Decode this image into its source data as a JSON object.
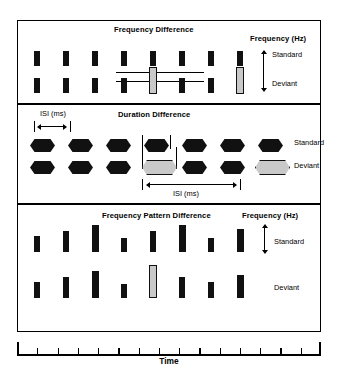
{
  "figure": {
    "axis_label": "Time",
    "axis_ticks": 14
  },
  "panels": [
    {
      "id": "frequency-difference",
      "title": "Frequency Difference",
      "legend_title": "Frequency (Hz)",
      "row_labels": [
        "Standard",
        "Deviant"
      ],
      "tone_shape": "rectangle",
      "tone_count": 8,
      "deviant_index": 4
    },
    {
      "id": "duration-difference",
      "title": "Duration Difference",
      "isi_label_top": "ISI (ms)",
      "isi_label_bottom": "ISI (ms)",
      "row_labels": [
        "Standard",
        "Deviant"
      ],
      "tone_shape": "hexagon",
      "tone_count": 7,
      "deviant_indices": [
        3,
        6
      ]
    },
    {
      "id": "frequency-pattern-difference",
      "title": "Frequency Pattern Difference",
      "legend_title": "Frequency (Hz)",
      "row_labels": [
        "Standard",
        "Deviant"
      ],
      "tone_shape": "rectangle",
      "tone_count": 8,
      "deviant_index": 4
    }
  ],
  "chart_data": {
    "type": "diagram",
    "xlabel": "Time",
    "ylabel": "Frequency (Hz)",
    "grid": false,
    "legend_position": "right",
    "panel_frequency_difference": {
      "title": "Frequency Difference",
      "series": [
        {
          "name": "Standard",
          "tone_x": [
            8,
            20,
            32,
            44,
            56,
            68,
            80,
            92
          ],
          "tone_frequency_level": [
            1,
            1,
            1,
            1,
            1,
            1,
            1,
            1
          ],
          "deviant_flags": [
            false,
            false,
            false,
            false,
            false,
            false,
            false,
            false
          ]
        },
        {
          "name": "Deviant",
          "tone_x": [
            8,
            20,
            32,
            44,
            56,
            68,
            80,
            92
          ],
          "tone_frequency_level": [
            1,
            1,
            1,
            1,
            2,
            1,
            1,
            2
          ],
          "deviant_flags": [
            false,
            false,
            false,
            false,
            true,
            false,
            false,
            true
          ]
        }
      ],
      "reference_lines": [
        "standard frequency level",
        "deviant frequency level"
      ],
      "legend_title": "Frequency (Hz)",
      "legend_arrow": "double-headed vertical"
    },
    "panel_duration_difference": {
      "title": "Duration Difference",
      "series": [
        {
          "name": "Standard",
          "tone_x": [
            8,
            22,
            36,
            50,
            64,
            78,
            92
          ],
          "tone_duration": [
            1,
            1,
            1,
            1,
            1,
            1,
            1
          ],
          "deviant_flags": [
            false,
            false,
            false,
            false,
            false,
            false,
            false
          ]
        },
        {
          "name": "Deviant",
          "tone_x": [
            8,
            22,
            36,
            50,
            64,
            78,
            92
          ],
          "tone_duration": [
            1,
            1,
            1,
            1.45,
            1,
            1,
            1.45
          ],
          "deviant_flags": [
            false,
            false,
            false,
            true,
            false,
            false,
            true
          ]
        }
      ],
      "annotations": [
        {
          "label": "ISI (ms)",
          "position": "top-left",
          "arrow": "double-headed horizontal"
        },
        {
          "label": "ISI (ms)",
          "position": "bottom-center",
          "arrow": "double-headed horizontal"
        }
      ]
    },
    "panel_frequency_pattern_difference": {
      "title": "Frequency Pattern Difference",
      "series": [
        {
          "name": "Standard",
          "tone_x": [
            8,
            20,
            32,
            44,
            56,
            68,
            80,
            92
          ],
          "tone_frequency_level": [
            2,
            3,
            5,
            1,
            3,
            5,
            1,
            4
          ],
          "deviant_flags": [
            false,
            false,
            false,
            false,
            false,
            false,
            false,
            false
          ]
        },
        {
          "name": "Deviant",
          "tone_x": [
            8,
            20,
            32,
            44,
            56,
            68,
            80,
            92
          ],
          "tone_frequency_level": [
            2,
            3,
            5,
            1,
            6,
            3,
            2,
            4
          ],
          "deviant_flags": [
            false,
            false,
            false,
            false,
            true,
            false,
            false,
            false
          ]
        }
      ],
      "legend_title": "Frequency (Hz)",
      "legend_arrow": "double-headed vertical"
    }
  },
  "colors": {
    "standard_tone": "#111111",
    "deviant_tone": "#c9c9c9",
    "outline": "#000000",
    "background": "#ffffff"
  }
}
